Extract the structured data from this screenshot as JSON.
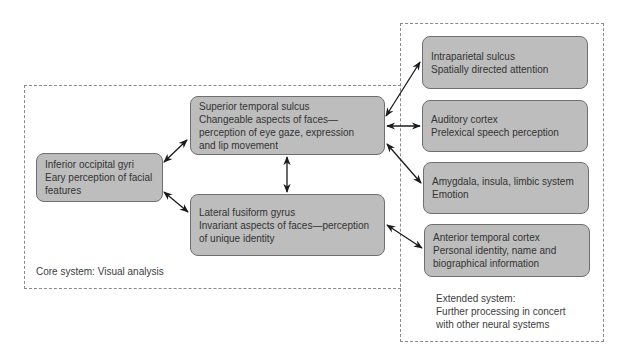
{
  "groups": {
    "core": {
      "label": "Core system: Visual analysis"
    },
    "extended": {
      "label": "Extended system:\nFurther processing in concert\nwith other neural systems"
    }
  },
  "nodes": {
    "inferior_occipital": {
      "title": "Inferior occipital gyri",
      "lines": [
        "Eary perception of facial",
        "features"
      ]
    },
    "superior_temporal": {
      "title": "Superior temporal sulcus",
      "lines": [
        "Changeable aspects of faces—",
        "perception of eye gaze, expression",
        "and lip movement"
      ]
    },
    "lateral_fusiform": {
      "title": "Lateral fusiform gyrus",
      "lines": [
        "Invariant aspects of faces—perception",
        "of unique identity"
      ]
    },
    "intraparietal": {
      "title": "Intraparietal sulcus",
      "lines": [
        "Spatially directed attention"
      ]
    },
    "auditory": {
      "title": "Auditory cortex",
      "lines": [
        "Prelexical speech perception"
      ]
    },
    "amygdala": {
      "title": "Amygdala, insula, limbic system",
      "lines": [
        "Emotion"
      ]
    },
    "anterior_temporal": {
      "title": "Anterior temporal cortex",
      "lines": [
        "Personal identity, name and",
        "biographical information"
      ]
    }
  },
  "colors": {
    "node_fill": "#bdbdbd",
    "node_border": "#6f6f6f",
    "arrow": "#1a1a1a",
    "dash": "#8a8a8a"
  }
}
